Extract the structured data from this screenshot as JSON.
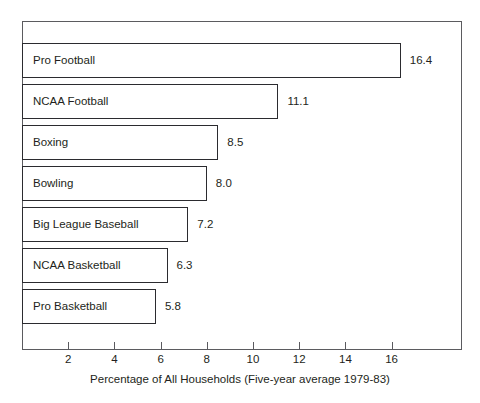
{
  "chart_data": {
    "type": "bar",
    "orientation": "horizontal",
    "title": "",
    "xlabel": "Percentage of All Households (Five-year average 1979-83)",
    "ylabel": "",
    "xlim": [
      0,
      17.8
    ],
    "grid": false,
    "legend": null,
    "categories": [
      "Pro Football",
      "NCAA Football",
      "Boxing",
      "Bowling",
      "Big League Baseball",
      "NCAA Basketball",
      "Pro Basketball"
    ],
    "values": [
      16.4,
      11.1,
      8.5,
      8.0,
      7.2,
      6.3,
      5.8
    ],
    "value_labels": [
      "16.4",
      "11.1",
      "8.5",
      "8.0",
      "7.2",
      "6.3",
      "5.8"
    ],
    "xticks": [
      2,
      4,
      6,
      8,
      10,
      12,
      14,
      16
    ],
    "xtick_labels": [
      "2",
      "4",
      "6",
      "8",
      "10",
      "12",
      "14",
      "16"
    ],
    "colors": {
      "bar_fill": "#ffffff",
      "bar_border": "#2b2b2f",
      "frame": "#5b5b5f",
      "text": "#231f20",
      "background": "#ffffff"
    }
  }
}
